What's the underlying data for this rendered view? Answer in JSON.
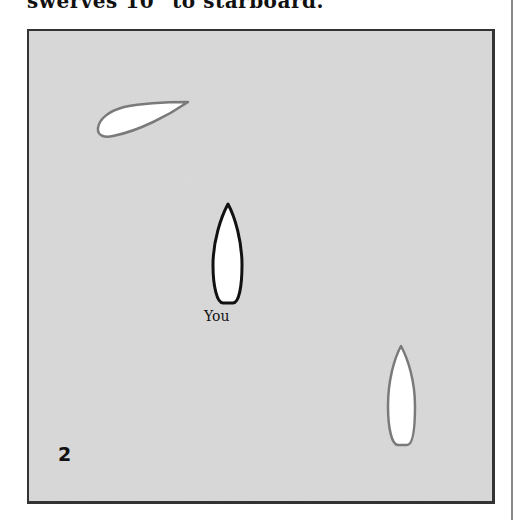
{
  "caption": "swerves 10° to starboard.",
  "diagram": {
    "scene_number": "2",
    "background_color": "#d8d8d8",
    "boats": [
      {
        "id": "other-boat-top-left",
        "outline_color": "#7a7a7a",
        "heading": "northeast",
        "label": ""
      },
      {
        "id": "own-boat",
        "outline_color": "#111111",
        "heading": "north",
        "label": "You"
      },
      {
        "id": "other-boat-bottom-right",
        "outline_color": "#7a7a7a",
        "heading": "north",
        "label": ""
      }
    ]
  }
}
